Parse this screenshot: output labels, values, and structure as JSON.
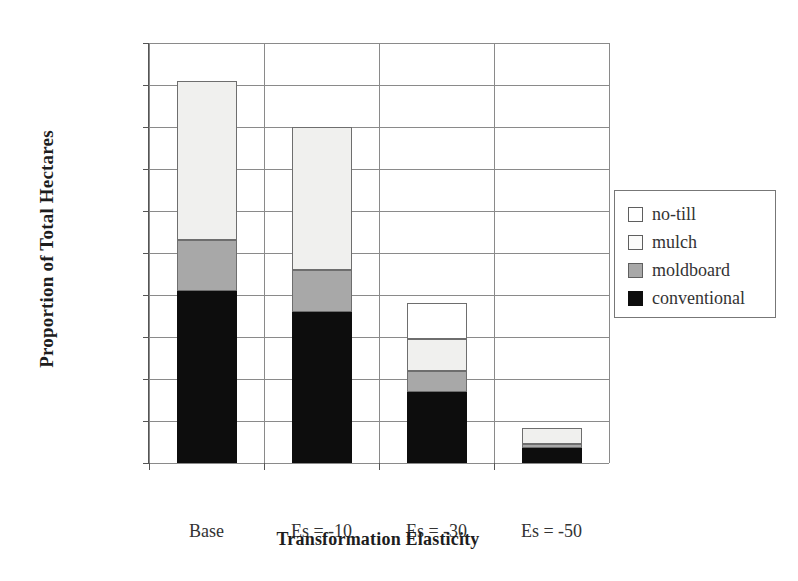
{
  "chart_data": {
    "type": "bar",
    "subtype": "stacked-bar",
    "title": "",
    "xlabel": "Transformation Elasticity",
    "ylabel": "Proportion of Total Hectares",
    "categories": [
      "Base",
      "Es = -10",
      "Es = -30",
      "Es = -50"
    ],
    "ylim": [
      0,
      100
    ],
    "yticks": [
      0,
      10,
      20,
      30,
      40,
      50,
      60,
      70,
      80,
      90,
      100
    ],
    "ytick_labels": [
      "0%",
      "10%",
      "20%",
      "30%",
      "40%",
      "50%",
      "60%",
      "70%",
      "80%",
      "90%",
      "100%"
    ],
    "grid": true,
    "legend_position": "right",
    "stack_order_bottom_to_top": [
      "conventional",
      "moldboard",
      "mulch",
      "no-till"
    ],
    "series": [
      {
        "name": "conventional",
        "color": "#0d0d0d",
        "values": [
          41.0,
          36.0,
          17.0,
          3.6
        ]
      },
      {
        "name": "moldboard",
        "color": "#a8a8a8",
        "values": [
          12.0,
          10.0,
          5.0,
          1.0
        ]
      },
      {
        "name": "mulch",
        "color": "#f0f0ee",
        "values": [
          38.0,
          34.0,
          7.5,
          3.7
        ]
      },
      {
        "name": "no-till",
        "color": "#ffffff",
        "values": [
          0.0,
          0.0,
          8.5,
          0.0
        ]
      }
    ],
    "totals": [
      91.0,
      80.0,
      38.0,
      8.3
    ]
  },
  "axes": {
    "y_title": "Proportion of Total Hectares",
    "x_title": "Transformation Elasticity",
    "ytick_labels": [
      "100%",
      "90%",
      "80%",
      "70%",
      "60%",
      "50%",
      "40%",
      "30%",
      "20%",
      "10%",
      "0%"
    ],
    "xtick_labels": [
      "Base",
      "Es = -10",
      "Es = -30",
      "Es = -50"
    ]
  },
  "legend": {
    "items": [
      {
        "label": "no-till",
        "swatch": "white-swatch"
      },
      {
        "label": "mulch",
        "swatch": "light-swatch"
      },
      {
        "label": "moldboard",
        "swatch": "gray-swatch"
      },
      {
        "label": "conventional",
        "swatch": "black-swatch"
      }
    ]
  },
  "colors": {
    "conventional": "#0d0d0d",
    "moldboard": "#a8a8a8",
    "mulch": "#f0f0ee",
    "notill": "#ffffff",
    "grid": "#8a8a8a",
    "axis": "#555555"
  }
}
